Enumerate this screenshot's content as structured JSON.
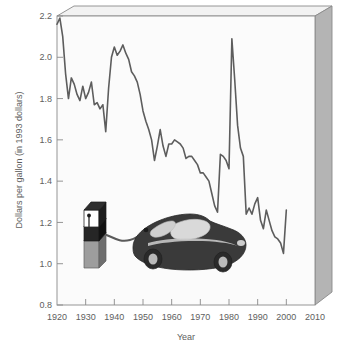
{
  "chart_data": {
    "type": "line",
    "title": "",
    "xlabel": "Year",
    "ylabel": "Dollars per gallon (in 1993 dollars)",
    "xlim": [
      1920,
      2010
    ],
    "ylim": [
      0.8,
      2.2
    ],
    "xticks": [
      1920,
      1930,
      1940,
      1950,
      1960,
      1970,
      1980,
      1990,
      2000,
      2010
    ],
    "yticks": [
      0.8,
      1.0,
      1.2,
      1.4,
      1.6,
      1.8,
      2.0,
      2.2
    ],
    "xtick_labels": [
      "1920",
      "1930",
      "1940",
      "1950",
      "1960",
      "1970",
      "1980",
      "1990",
      "2000",
      "2010"
    ],
    "ytick_labels": [
      "0.8",
      "1.0",
      "1.2",
      "1.4",
      "1.6",
      "1.8",
      "2.0",
      "2.2"
    ],
    "grid": false,
    "legend": null,
    "line_color": "#5d5d5d",
    "plot_background": "#fbfbfb",
    "frame_color": "#8a8a8a",
    "series": [
      {
        "name": "Gasoline price",
        "x": [
          1920,
          1921,
          1922,
          1923,
          1924,
          1925,
          1926,
          1927,
          1928,
          1929,
          1930,
          1931,
          1932,
          1933,
          1934,
          1935,
          1936,
          1937,
          1938,
          1939,
          1940,
          1941,
          1942,
          1943,
          1944,
          1945,
          1946,
          1947,
          1948,
          1949,
          1950,
          1951,
          1952,
          1953,
          1954,
          1955,
          1956,
          1957,
          1958,
          1959,
          1960,
          1961,
          1962,
          1963,
          1964,
          1965,
          1966,
          1967,
          1968,
          1969,
          1970,
          1971,
          1972,
          1973,
          1974,
          1975,
          1976,
          1977,
          1978,
          1979,
          1980,
          1981,
          1982,
          1983,
          1984,
          1985,
          1986,
          1987,
          1988,
          1989,
          1990,
          1991,
          1992,
          1993,
          1994,
          1995,
          1996,
          1997,
          1998,
          1999,
          2000
        ],
        "values": [
          2.16,
          2.19,
          2.1,
          1.92,
          1.8,
          1.9,
          1.87,
          1.82,
          1.79,
          1.86,
          1.8,
          1.83,
          1.88,
          1.77,
          1.78,
          1.75,
          1.77,
          1.64,
          1.85,
          2.0,
          2.05,
          2.01,
          2.03,
          2.06,
          2.02,
          1.99,
          1.93,
          1.91,
          1.88,
          1.82,
          1.74,
          1.69,
          1.65,
          1.6,
          1.5,
          1.57,
          1.65,
          1.57,
          1.52,
          1.58,
          1.58,
          1.6,
          1.59,
          1.58,
          1.56,
          1.51,
          1.52,
          1.52,
          1.5,
          1.48,
          1.44,
          1.44,
          1.42,
          1.4,
          1.34,
          1.28,
          1.25,
          1.53,
          1.52,
          1.5,
          1.46,
          2.09,
          1.89,
          1.67,
          1.56,
          1.52,
          1.24,
          1.27,
          1.24,
          1.29,
          1.32,
          1.21,
          1.17,
          1.26,
          1.21,
          1.16,
          1.13,
          1.12,
          1.1,
          1.05,
          1.26
        ]
      }
    ]
  },
  "illustration": {
    "pump": {
      "name": "gas-pump",
      "body_color": "#2b2b2b",
      "top_color": "#ffffff",
      "base_color": "#9a9a9a"
    },
    "car": {
      "name": "car",
      "body_color": "#3a3a3a",
      "glass_color": "#d6d6d6"
    },
    "hose_color": "#5a5a5a"
  },
  "frame": {
    "top_face_color": "#f2f2f2",
    "side_face_color": "#b4b4b4",
    "edge_color": "#7c7c7c"
  }
}
